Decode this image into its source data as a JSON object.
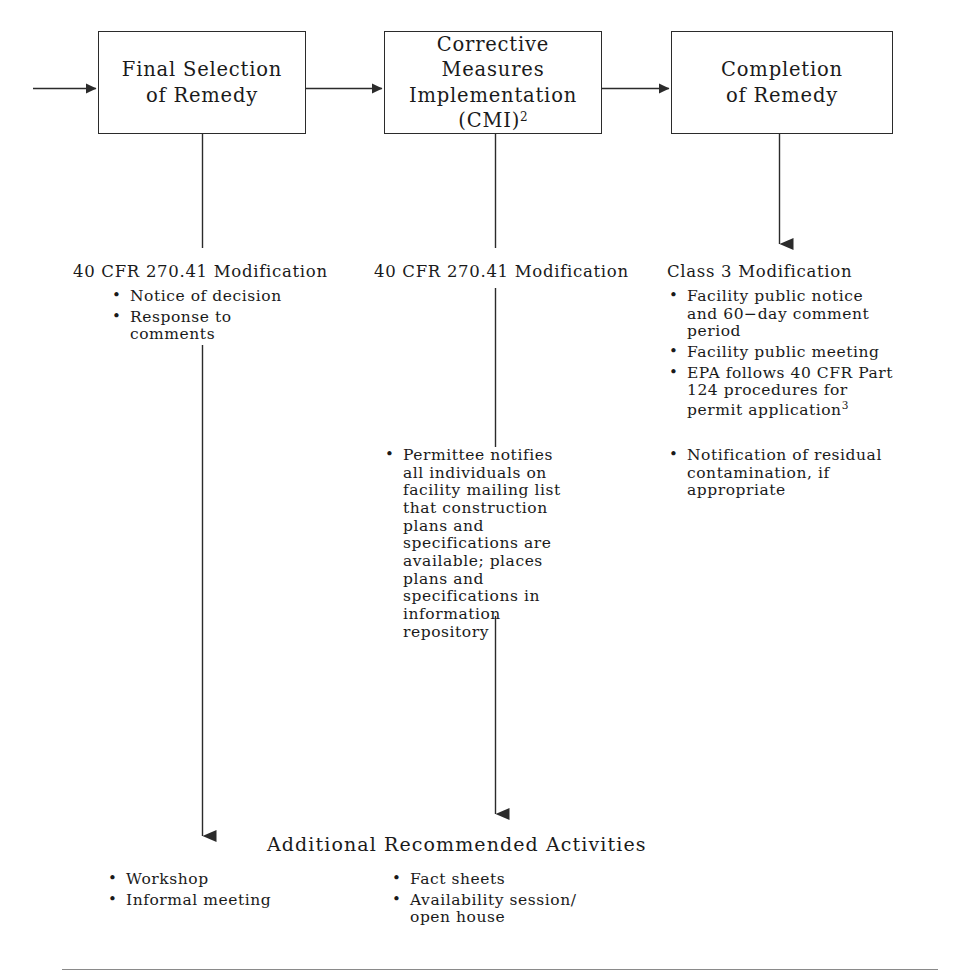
{
  "diagram": {
    "title": "Additional Recommended Activities",
    "line_color": "#2b2b2b",
    "rule_color": "#8a8a8a",
    "background": "#ffffff",
    "boxes": [
      {
        "id": "final-selection-of-remedy",
        "label": "Final Selection\nof Remedy",
        "sup": ""
      },
      {
        "id": "corrective-measures-implementation",
        "label": "Corrective\nMeasures\nImplementation\n(CMI)",
        "sup": "2"
      },
      {
        "id": "completion-of-remedy",
        "label": "Completion\nof Remedy",
        "sup": ""
      }
    ],
    "columns": [
      {
        "id": "column-final-selection",
        "heading": "40 CFR 270.41 Modification",
        "bullets": [
          {
            "text": "Notice of decision",
            "sup": ""
          },
          {
            "text": "Response to\ncomments",
            "sup": ""
          }
        ],
        "lower_bullets": []
      },
      {
        "id": "column-cmi",
        "heading": "40 CFR 270.41 Modification",
        "bullets": [],
        "lower_bullets": [
          {
            "text": "Permittee notifies\nall individuals on\nfacility mailing list\nthat construction\nplans and\nspecifications are\navailable; places\nplans and\nspecifications in\ninformation\nrepository",
            "sup": ""
          }
        ]
      },
      {
        "id": "column-completion",
        "heading": "Class 3 Modification",
        "bullets": [
          {
            "text": "Facility public notice\nand 60−day comment\nperiod",
            "sup": ""
          },
          {
            "text": "Facility public meeting",
            "sup": ""
          },
          {
            "text": "EPA follows 40 CFR Part\n124 procedures for\npermit application",
            "sup": "3"
          }
        ],
        "lower_bullets": [
          {
            "text": "Notification of residual\ncontamination, if\nappropriate",
            "sup": ""
          }
        ]
      }
    ],
    "additional_activities": [
      {
        "id": "additional-left",
        "bullets": [
          {
            "text": "Workshop"
          },
          {
            "text": "Informal meeting"
          }
        ]
      },
      {
        "id": "additional-middle",
        "bullets": [
          {
            "text": "Fact sheets"
          },
          {
            "text": "Availability session/\nopen house"
          }
        ]
      }
    ]
  }
}
